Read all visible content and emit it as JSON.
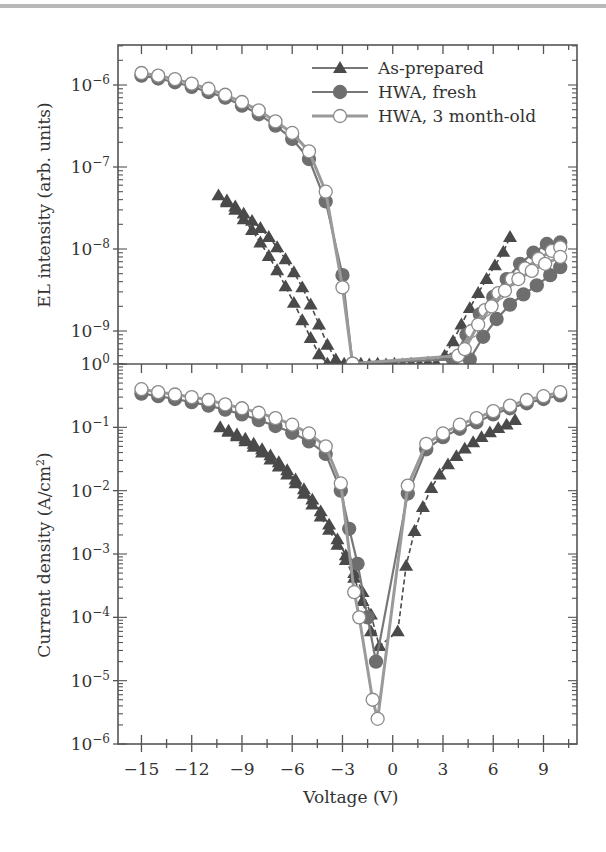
{
  "chart_data": [
    {
      "type": "scatter",
      "panel": "top",
      "ylabel": "EL intensity (arb. units)",
      "xlabel": "",
      "yscale": "log",
      "ylim": [
        3.5e-10,
        3e-06
      ],
      "xlim": [
        -16.4,
        11.0
      ],
      "y_ticks": [
        "10^-6",
        "10^-7",
        "10^-8",
        "10^-9"
      ],
      "legend": {
        "position": "upper right",
        "entries": [
          {
            "label": "As-prepared",
            "marker": "filled-triangle"
          },
          {
            "label": "HWA, fresh",
            "marker": "filled-circle"
          },
          {
            "label": "HWA, 3 month-old",
            "marker": "open-circle"
          }
        ]
      },
      "series": [
        {
          "name": "As-prepared (sweep 1)",
          "marker": "filled-triangle",
          "x": [
            -10.4,
            -9.9,
            -9.4,
            -8.9,
            -8.4,
            -7.9,
            -7.4,
            -6.9,
            -6.4,
            -5.9,
            -5.4,
            -4.9,
            -4.4,
            -3.9,
            -3.4,
            -2.9,
            -2.4,
            -1.9,
            -1.4,
            -0.9,
            -0.4,
            0.1,
            0.6,
            1.1,
            1.6,
            2.1,
            2.6,
            3.1,
            3.6,
            4.1,
            4.6,
            5.1,
            5.6,
            6.1,
            6.6,
            7.0
          ],
          "y": [
            4.5e-08,
            3.9e-08,
            3.3e-08,
            2.7e-08,
            2.2e-08,
            1.8e-08,
            1.4e-08,
            1.05e-08,
            7.5e-09,
            5.2e-09,
            3.4e-09,
            2.1e-09,
            1.2e-09,
            6.8e-10,
            4.5e-10,
            4e-10,
            3.9e-10,
            4e-10,
            3.9e-10,
            4e-10,
            3.9e-10,
            4e-10,
            3.9e-10,
            4e-10,
            3.9e-10,
            4.1e-10,
            4e-10,
            5e-10,
            7.5e-10,
            1.2e-09,
            1.9e-09,
            2.9e-09,
            4.3e-09,
            6.3e-09,
            9.2e-09,
            1.4e-08
          ]
        },
        {
          "name": "As-prepared (sweep 2)",
          "marker": "filled-triangle",
          "x": [
            -9.9,
            -9.4,
            -8.9,
            -8.4,
            -7.9,
            -7.4,
            -6.9,
            -6.4,
            -5.9,
            -5.4,
            -4.9,
            -4.4,
            -3.9,
            -3.4,
            -2.9,
            -2.4
          ],
          "y": [
            3.7e-08,
            3e-08,
            2.3e-08,
            1.7e-08,
            1.2e-08,
            8.2e-09,
            5.5e-09,
            3.5e-09,
            2.2e-09,
            1.35e-09,
            8.2e-10,
            5.2e-10,
            4e-10,
            3.7e-10,
            3.6e-10,
            3.7e-10
          ]
        },
        {
          "name": "HWA, fresh",
          "marker": "filled-circle",
          "x": [
            -15,
            -14,
            -13,
            -12,
            -11,
            -10,
            -9,
            -8,
            -7,
            -6,
            -5,
            -4,
            -3,
            -2.4,
            3.6,
            4.4,
            5.2,
            6.0,
            6.8,
            7.6,
            8.4,
            9.2,
            10.0
          ],
          "y": [
            1.3e-06,
            1.2e-06,
            1.08e-06,
            9.5e-07,
            8.2e-07,
            7e-07,
            5.6e-07,
            4.4e-07,
            3.2e-07,
            2.2e-07,
            1.25e-07,
            3.8e-08,
            4.8e-09,
            4e-10,
            4.5e-10,
            9e-10,
            1.6e-09,
            2.6e-09,
            4.3e-09,
            6.6e-09,
            9e-09,
            1.15e-08,
            1.2e-08
          ]
        },
        {
          "name": "HWA, fresh (sweep 2)",
          "marker": "filled-circle",
          "x": [
            4.6,
            5.4,
            6.2,
            7.0,
            7.8,
            8.6,
            9.4,
            10.0
          ],
          "y": [
            4.5e-10,
            8.5e-10,
            1.4e-09,
            2.1e-09,
            2.8e-09,
            3.6e-09,
            4.8e-09,
            6e-09
          ]
        },
        {
          "name": "HWA, 3 month-old",
          "marker": "open-circle",
          "x": [
            -15,
            -14,
            -13,
            -12,
            -11,
            -10,
            -9,
            -8,
            -7,
            -6,
            -5,
            -4,
            -3,
            -2.4,
            3.9,
            4.7,
            5.5,
            6.3,
            7.1,
            7.9,
            8.7,
            9.5,
            10.0
          ],
          "y": [
            1.4e-06,
            1.3e-06,
            1.18e-06,
            1.04e-06,
            9e-07,
            7.6e-07,
            6.2e-07,
            4.9e-07,
            3.6e-07,
            2.6e-07,
            1.55e-07,
            5e-08,
            3.4e-09,
            4e-10,
            5e-10,
            1e-09,
            1.8e-09,
            2.9e-09,
            4.3e-09,
            5.8e-09,
            7.6e-09,
            9.5e-09,
            1.05e-08
          ]
        },
        {
          "name": "HWA, 3 month-old (sweep 2)",
          "marker": "open-circle",
          "x": [
            4.3,
            5.1,
            5.9,
            6.7,
            7.5,
            8.3,
            9.1,
            10.0
          ],
          "y": [
            6e-10,
            1.2e-09,
            2e-09,
            3.1e-09,
            4.3e-09,
            5.4e-09,
            6.6e-09,
            8e-09
          ]
        }
      ]
    },
    {
      "type": "scatter",
      "panel": "bottom",
      "ylabel": "Current density (A/cm^2)",
      "xlabel": "Voltage (V)",
      "yscale": "log",
      "ylim": [
        1e-06,
        1.0
      ],
      "xlim": [
        -16.4,
        11.0
      ],
      "x_ticks": [
        -15,
        -12,
        -9,
        -6,
        -3,
        0,
        3,
        6,
        9
      ],
      "y_ticks": [
        "10^0",
        "10^-1",
        "10^-2",
        "10^-3",
        "10^-4",
        "10^-5",
        "10^-6"
      ],
      "series": [
        {
          "name": "As-prepared",
          "marker": "filled-triangle",
          "x": [
            -10.3,
            -9.8,
            -9.3,
            -8.8,
            -8.3,
            -7.8,
            -7.3,
            -6.8,
            -6.3,
            -5.8,
            -5.3,
            -4.8,
            -4.3,
            -3.8,
            -3.3,
            -2.8,
            -2.3,
            -1.8,
            -1.3,
            -0.8,
            0.3,
            0.8,
            1.3,
            1.8,
            2.3,
            2.8,
            3.3,
            3.8,
            4.3,
            4.8,
            5.3,
            5.8,
            6.3,
            6.8,
            7.3
          ],
          "y": [
            0.1,
            0.088,
            0.077,
            0.066,
            0.055,
            0.045,
            0.036,
            0.028,
            0.021,
            0.015,
            0.0105,
            0.0072,
            0.0047,
            0.0029,
            0.0017,
            0.00095,
            0.0005,
            0.00025,
            0.00011,
            3.5e-05,
            6e-05,
            0.00065,
            0.0023,
            0.0055,
            0.011,
            0.018,
            0.026,
            0.035,
            0.046,
            0.058,
            0.07,
            0.083,
            0.097,
            0.11,
            0.13
          ]
        },
        {
          "name": "As-prepared (sweep 2)",
          "marker": "filled-triangle",
          "x": [
            -9.8,
            -9.3,
            -8.8,
            -8.3,
            -7.8,
            -7.3,
            -6.8,
            -6.3,
            -5.8,
            -5.3,
            -4.8,
            -4.3,
            -3.8,
            -3.3,
            -2.8,
            -2.3,
            -1.8,
            -1.3
          ],
          "y": [
            0.085,
            0.072,
            0.06,
            0.049,
            0.04,
            0.031,
            0.024,
            0.018,
            0.013,
            0.0089,
            0.006,
            0.0039,
            0.0024,
            0.0014,
            0.0008,
            0.00042,
            0.00018,
            6e-05
          ]
        },
        {
          "name": "HWA, fresh",
          "marker": "filled-circle",
          "x": [
            -15,
            -14,
            -13,
            -12,
            -11,
            -10,
            -9,
            -8,
            -7,
            -6,
            -5,
            -4,
            -3.1,
            -2.6,
            -2.1,
            -1.5,
            -1.0,
            0.9,
            2.0,
            3.0,
            4.0,
            5.0,
            6.0,
            7.0,
            8.0,
            9.0,
            10.0
          ],
          "y": [
            0.34,
            0.31,
            0.28,
            0.25,
            0.22,
            0.19,
            0.16,
            0.13,
            0.105,
            0.082,
            0.06,
            0.038,
            0.01,
            0.0025,
            0.0007,
            0.0001,
            2e-05,
            0.009,
            0.045,
            0.07,
            0.095,
            0.12,
            0.16,
            0.2,
            0.24,
            0.28,
            0.32
          ]
        },
        {
          "name": "HWA, 3 month-old",
          "marker": "open-circle",
          "x": [
            -15,
            -14,
            -13,
            -12,
            -11,
            -10,
            -9,
            -8,
            -7,
            -6,
            -5,
            -4,
            -3.1,
            -2.3,
            -2.0,
            -1.2,
            -0.9,
            0.9,
            2.0,
            3.0,
            4.0,
            5.0,
            6.0,
            7.0,
            8.0,
            9.0,
            10.0
          ],
          "y": [
            0.4,
            0.36,
            0.33,
            0.3,
            0.27,
            0.23,
            0.2,
            0.17,
            0.14,
            0.11,
            0.08,
            0.05,
            0.013,
            0.00025,
            0.0001,
            5e-06,
            2.5e-06,
            0.012,
            0.055,
            0.08,
            0.11,
            0.14,
            0.18,
            0.22,
            0.27,
            0.31,
            0.36
          ]
        }
      ]
    }
  ],
  "labels": {
    "top_ylabel": "EL intensity (arb. units)",
    "bottom_ylabel_main": "Current density (A/cm",
    "bottom_ylabel_sup": "2",
    "bottom_ylabel_end": ")",
    "xlabel": "Voltage (V)",
    "legend_0": "As-prepared",
    "legend_1": "HWA, fresh",
    "legend_2": "HWA, 3 month-old"
  },
  "colors": {
    "axis": "#555555",
    "triangle": "#4a4a4a",
    "fresh_fill": "#6e6e6e",
    "fresh_line": "#777777",
    "old_line": "#9a9a9a",
    "old_fill": "#ffffff",
    "top_rule": "#b8b8b8"
  }
}
